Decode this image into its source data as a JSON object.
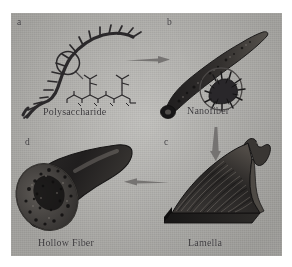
{
  "figure": {
    "type": "four-panel schematic diagram",
    "background_color": "#b9b8b4",
    "ink_color": "#2b292b",
    "arrow_color": "#6d6b6a"
  },
  "panels": [
    {
      "letter": "a",
      "caption": "Polysaccharide",
      "content": "branched polysaccharide chain with circled magnified region and chemical repeat-unit structure inset"
    },
    {
      "letter": "b",
      "caption": "Nanofiber",
      "content": "tapered dark nanofiber with circular magnified inset showing bristled cross-section"
    },
    {
      "letter": "c",
      "caption": "Lamella",
      "content": "wedge-shaped layered lamella block with striated surface"
    },
    {
      "letter": "d",
      "caption": "Hollow Fiber",
      "content": "cut hollow fiber showing porous cross-section"
    }
  ],
  "arrows": [
    {
      "name": "arrow-a-to-b",
      "direction": "right"
    },
    {
      "name": "arrow-b-to-c",
      "direction": "down"
    },
    {
      "name": "arrow-c-to-d",
      "direction": "left"
    }
  ]
}
